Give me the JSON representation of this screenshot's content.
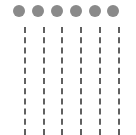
{
  "figure": {
    "width": 136,
    "height": 135,
    "background": "#ffffff",
    "dot_color": "#8a8a8a",
    "line_color": "#606060",
    "dots": [
      {
        "cx": 19,
        "cy": 11
      },
      {
        "cx": 38,
        "cy": 11
      },
      {
        "cx": 57,
        "cy": 11
      },
      {
        "cx": 76,
        "cy": 11
      },
      {
        "cx": 95,
        "cy": 11
      },
      {
        "cx": 113,
        "cy": 11
      }
    ],
    "dot_radius": 6,
    "lines": [
      {
        "x": 25
      },
      {
        "x": 44
      },
      {
        "x": 62
      },
      {
        "x": 81
      },
      {
        "x": 100
      },
      {
        "x": 119
      }
    ],
    "line_top": 27,
    "line_bottom": 135,
    "line_width": 2
  }
}
